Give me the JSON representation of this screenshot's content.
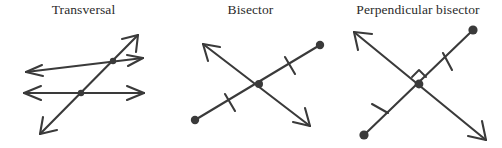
{
  "figure": {
    "name": "geometry-terms-illustration",
    "background_color": "#ffffff",
    "stroke_color": "#3a3a3a",
    "text_color": "#2b2b2b",
    "panels": [
      {
        "id": "transversal",
        "title": "Transversal",
        "description": "Two parallel lines cut by a transversal line",
        "elements": {
          "parallel_line_upper": "arrowed line both ends",
          "parallel_line_lower": "arrowed line both ends",
          "transversal_line": "arrowed line both ends crossing both parallels",
          "intersection_points": 2
        }
      },
      {
        "id": "bisector",
        "title": "Bisector",
        "description": "A line bisecting a segment into two congruent parts marked with single tick marks",
        "elements": {
          "segment_endpoints": 2,
          "bisecting_line": "arrowed line both ends",
          "tick_marks": 2,
          "intersection_points": 1
        }
      },
      {
        "id": "perpendicular-bisector",
        "title": "Perpendicular bisector",
        "description": "A line bisecting a segment at a right angle, congruent halves marked with single tick marks",
        "elements": {
          "segment_endpoints": 2,
          "bisecting_line": "arrowed line both ends",
          "tick_marks": 2,
          "right_angle_marker": 1,
          "intersection_points": 1
        }
      }
    ]
  }
}
